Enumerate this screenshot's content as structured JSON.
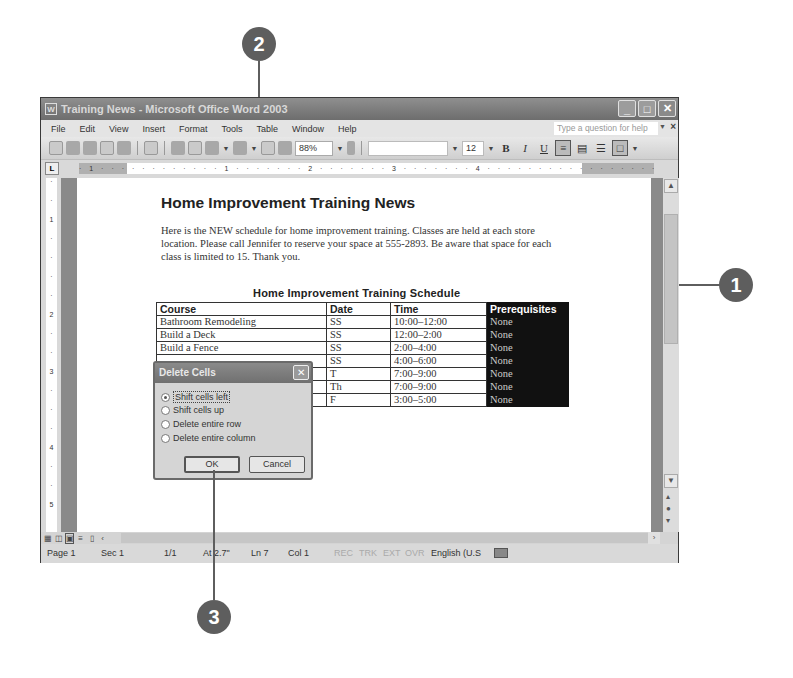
{
  "callouts": [
    {
      "number": "1"
    },
    {
      "number": "2"
    },
    {
      "number": "3"
    }
  ],
  "window": {
    "title": "Training News - Microsoft Office Word 2003",
    "buttons": {
      "minimize": "_",
      "maximize": "□",
      "close": "✕"
    }
  },
  "menubar": {
    "items": [
      {
        "label": "File"
      },
      {
        "label": "Edit"
      },
      {
        "label": "View"
      },
      {
        "label": "Insert"
      },
      {
        "label": "Format"
      },
      {
        "label": "Tools"
      },
      {
        "label": "Table"
      },
      {
        "label": "Window"
      },
      {
        "label": "Help"
      }
    ],
    "help_placeholder": "Type a question for help",
    "doc_close": "×"
  },
  "toolbar": {
    "zoom": "88%",
    "font_name": "",
    "font_size": "12",
    "bold": "B",
    "italic": "I",
    "underline": "U"
  },
  "ruler": {
    "text": "· 1 · · · · · · · · · · · · 1 · · · · · · · 2 · · · · · · · 3 · · · · · · · 4 · · · · · · · · · · · · · · · · · · · · · 7 · · ·"
  },
  "vruler": {
    "marks": [
      "·",
      "·",
      "1",
      "·",
      "·",
      "·",
      "·",
      "2",
      "·",
      "·",
      "3",
      "·",
      "·",
      "·",
      "4",
      "·",
      "·",
      "5"
    ]
  },
  "document": {
    "title": "Home Improvement Training News",
    "paragraph": "Here is the NEW schedule for home improvement training. Classes are held at each store location. Please call Jennifer to reserve your space at 555-2893. Be aware that space for each class is limited to 15. Thank you.",
    "table_title": "Home Improvement Training Schedule",
    "table": {
      "headers": [
        "Course",
        "Date",
        "Time",
        "Prerequisites"
      ],
      "rows": [
        [
          "Bathroom Remodeling",
          "SS",
          "10:00–12:00",
          "None"
        ],
        [
          "Build a Deck",
          "SS",
          "12:00–2:00",
          "None"
        ],
        [
          "Build a Fence",
          "SS",
          "2:00–4:00",
          "None"
        ],
        [
          "",
          "SS",
          "4:00–6:00",
          "None"
        ],
        [
          "",
          "T",
          "7:00–9:00",
          "None"
        ],
        [
          "",
          "Th",
          "7:00–9:00",
          "None"
        ],
        [
          "",
          "F",
          "3:00–5:00",
          "None"
        ]
      ]
    }
  },
  "dialog": {
    "title": "Delete Cells",
    "close": "✕",
    "options": [
      {
        "label": "Shift cells left",
        "selected": true
      },
      {
        "label": "Shift cells up",
        "selected": false
      },
      {
        "label": "Delete entire row",
        "selected": false
      },
      {
        "label": "Delete entire column",
        "selected": false
      }
    ],
    "ok": "OK",
    "cancel": "Cancel"
  },
  "statusbar": {
    "page": "Page 1",
    "sec": "Sec 1",
    "pages": "1/1",
    "at": "At 2.7\"",
    "ln": "Ln 7",
    "col": "Col 1",
    "rec": "REC",
    "trk": "TRK",
    "ext": "EXT",
    "ovr": "OVR",
    "language": "English (U.S"
  }
}
